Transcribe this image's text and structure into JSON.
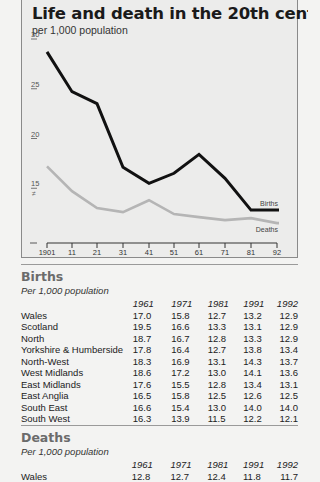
{
  "header": {
    "title": "Life and death in the 20th century",
    "subtitle": "per 1,000 population"
  },
  "chart_data": {
    "type": "line",
    "title": "Life and death in the 20th century",
    "subtitle": "per 1,000 population",
    "xlabel": "",
    "ylabel": "per 1,000 population",
    "x": [
      "1901",
      "11",
      "21",
      "31",
      "41",
      "51",
      "61",
      "71",
      "81",
      "92"
    ],
    "y_ticks": [
      "30",
      "25",
      "20",
      "15"
    ],
    "ylim": [
      9.5,
      30
    ],
    "series": [
      {
        "name": "Births",
        "color": "#111111",
        "values": [
          28.6,
          24.6,
          23.4,
          17.0,
          15.4,
          16.4,
          18.3,
          15.9,
          12.7,
          12.7
        ]
      },
      {
        "name": "Deaths",
        "color": "#b5b5b5",
        "values": [
          17.1,
          14.6,
          12.9,
          12.5,
          13.7,
          12.3,
          12.0,
          11.7,
          11.9,
          11.4
        ]
      }
    ],
    "legend_position": "inline at line ends"
  },
  "tables": [
    {
      "title": "Births",
      "subtitle": "Per 1,000 population",
      "columns": [
        "1961",
        "1971",
        "1981",
        "1991",
        "1992"
      ],
      "rows": [
        {
          "region": "Wales",
          "values": [
            "17.0",
            "15.8",
            "12.7",
            "13.2",
            "12.9"
          ]
        },
        {
          "region": "Scotland",
          "values": [
            "19.5",
            "16.6",
            "13.3",
            "13.1",
            "12.9"
          ]
        },
        {
          "region": "North",
          "values": [
            "18.7",
            "16.7",
            "12.8",
            "13.3",
            "12.9"
          ]
        },
        {
          "region": "Yorkshire & Humberside",
          "values": [
            "17.8",
            "16.4",
            "12.7",
            "13.8",
            "13.4"
          ]
        },
        {
          "region": "North-West",
          "values": [
            "18.3",
            "16.9",
            "13.1",
            "14.3",
            "13.7"
          ]
        },
        {
          "region": "West Midlands",
          "values": [
            "18.6",
            "17.2",
            "13.0",
            "14.1",
            "13.6"
          ]
        },
        {
          "region": "East Midlands",
          "values": [
            "17.6",
            "15.5",
            "12.8",
            "13.4",
            "13.1"
          ]
        },
        {
          "region": "East Anglia",
          "values": [
            "16.5",
            "15.8",
            "12.5",
            "12.6",
            "12.5"
          ]
        },
        {
          "region": "South East",
          "values": [
            "16.6",
            "15.4",
            "13.0",
            "14.0",
            "14.0"
          ]
        },
        {
          "region": "South West",
          "values": [
            "16.3",
            "13.9",
            "11.5",
            "12.2",
            "12.1"
          ]
        }
      ]
    },
    {
      "title": "Deaths",
      "subtitle": "Per 1,000 population",
      "columns": [
        "1961",
        "1971",
        "1981",
        "1991",
        "1992"
      ],
      "rows": [
        {
          "region": "Wales",
          "values": [
            "12.8",
            "12.7",
            "12.4",
            "11.8",
            "11.7"
          ]
        }
      ]
    }
  ]
}
